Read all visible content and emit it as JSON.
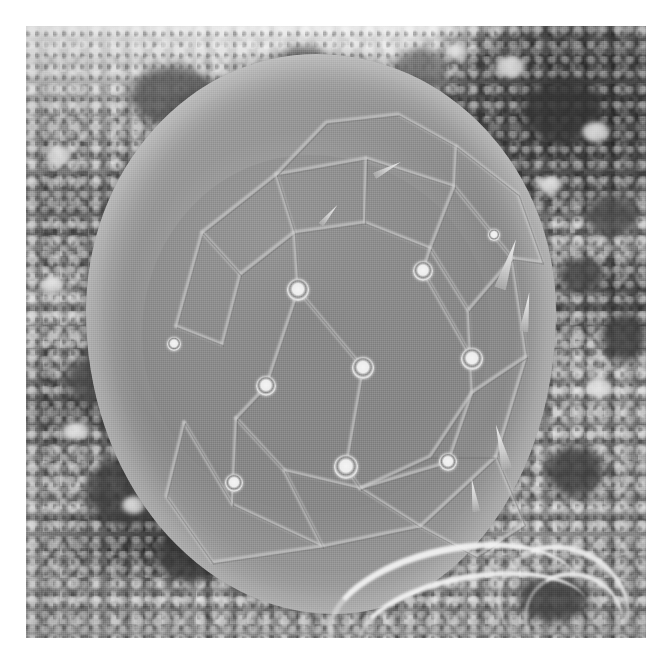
{
  "image": {
    "kind": "sem-micrograph",
    "title": "Scanning electron micrograph of a spherical microfossil / cyst",
    "caption": "",
    "border_color": "#ffffff",
    "plate": {
      "x": 26,
      "y": 26,
      "width": 620,
      "height": 612
    }
  },
  "palette": {
    "paper_white": "#ffffff",
    "highlight": "#f2f2f2",
    "rim_bright": "#d8d8d8",
    "plate_mid_gray": "#8f8f8f",
    "seam_light": "#cfcfcf",
    "substrate_gray": "#8a8a8a",
    "void_dark": "#3a3a3a",
    "deep_shadow": "#2e2e2e"
  },
  "specimen": {
    "name": "central-sphere",
    "description": "Large sub-spherical body covered by interlocking polygonal plates with raised seams and circular pores",
    "bounds": {
      "x": 60,
      "y": 28,
      "width": 470,
      "height": 560
    },
    "fill": "#8f8f8f",
    "rim_highlight": "#d8d8d8"
  },
  "pores": [
    {
      "id": "pore-1",
      "cx": 272,
      "cy": 264,
      "r": 11
    },
    {
      "id": "pore-2",
      "cx": 337,
      "cy": 342,
      "r": 11
    },
    {
      "id": "pore-3",
      "cx": 240,
      "cy": 360,
      "r": 10
    },
    {
      "id": "pore-4",
      "cx": 446,
      "cy": 333,
      "r": 11
    },
    {
      "id": "pore-5",
      "cx": 320,
      "cy": 441,
      "r": 12
    },
    {
      "id": "pore-6",
      "cx": 422,
      "cy": 436,
      "r": 9
    },
    {
      "id": "pore-7",
      "cx": 397,
      "cy": 245,
      "r": 10
    },
    {
      "id": "pore-8",
      "cx": 208,
      "cy": 457,
      "r": 9
    },
    {
      "id": "pore-9",
      "cx": 148,
      "cy": 318,
      "r": 7
    },
    {
      "id": "pore-10",
      "cx": 468,
      "cy": 209,
      "r": 6
    }
  ],
  "plate_seams": [
    {
      "id": "seam-outer-ring",
      "points": "150,300 176,206 250,148 340,132 428,160 486,232 500,330 470,430 394,500 296,520 206,478 158,396"
    },
    {
      "id": "seam-inner-ring",
      "points": "196,318 214,248 268,206 338,196 404,222 442,284 446,366 404,430 334,462 258,444 210,392"
    },
    {
      "id": "seam-r1",
      "points": "250,148 268,206"
    },
    {
      "id": "seam-r2",
      "points": "340,132 338,196"
    },
    {
      "id": "seam-r3",
      "points": "428,160 404,222"
    },
    {
      "id": "seam-r4",
      "points": "486,232 442,284"
    },
    {
      "id": "seam-r5",
      "points": "500,330 446,366"
    },
    {
      "id": "seam-r6",
      "points": "470,430 404,430"
    },
    {
      "id": "seam-r7",
      "points": "394,500 334,462"
    },
    {
      "id": "seam-r8",
      "points": "296,520 258,444"
    },
    {
      "id": "seam-r9",
      "points": "206,478 210,392"
    },
    {
      "id": "seam-r10",
      "points": "150,300 196,318"
    },
    {
      "id": "seam-r11",
      "points": "176,206 214,248"
    },
    {
      "id": "seam-c1",
      "points": "268,206 272,264 337,342"
    },
    {
      "id": "seam-c2",
      "points": "404,222 397,245 446,333"
    },
    {
      "id": "seam-c3",
      "points": "210,392 240,360 272,264"
    },
    {
      "id": "seam-c4",
      "points": "334,462 320,441 337,342"
    },
    {
      "id": "seam-c5",
      "points": "446,366 422,436 334,462"
    },
    {
      "id": "seam-top-lobe",
      "points": "250,148 300,96 372,88 430,120 428,160"
    },
    {
      "id": "seam-upper-flank",
      "points": "430,120 492,168 516,236 486,232"
    },
    {
      "id": "seam-lower-left",
      "points": "158,396 140,470 186,536 296,520"
    },
    {
      "id": "seam-lower-right",
      "points": "394,500 450,530 498,498 470,430"
    }
  ],
  "background": {
    "name": "granular-substrate",
    "description": "Porous, granular debris matrix surrounding the specimen with dark voids and bright flecks"
  },
  "voids": [
    {
      "id": "void-1",
      "x": 498,
      "y": 52,
      "w": 78,
      "h": 66,
      "color": "#373737"
    },
    {
      "id": "void-2",
      "x": 560,
      "y": 170,
      "w": 52,
      "h": 40,
      "color": "#4a4a4a"
    },
    {
      "id": "void-3",
      "x": 534,
      "y": 232,
      "w": 44,
      "h": 34,
      "color": "#454545"
    },
    {
      "id": "void-4",
      "x": 576,
      "y": 288,
      "w": 44,
      "h": 48,
      "color": "#3f3f3f"
    },
    {
      "id": "void-5",
      "x": 104,
      "y": 40,
      "w": 86,
      "h": 60,
      "color": "#5a5a5a"
    },
    {
      "id": "void-6",
      "x": 40,
      "y": 330,
      "w": 60,
      "h": 48,
      "color": "#4e4e4e"
    },
    {
      "id": "void-7",
      "x": 60,
      "y": 430,
      "w": 80,
      "h": 70,
      "color": "#3d3d3d"
    },
    {
      "id": "void-8",
      "x": 130,
      "y": 500,
      "w": 70,
      "h": 56,
      "color": "#3a3a3a"
    },
    {
      "id": "void-9",
      "x": 520,
      "y": 420,
      "w": 58,
      "h": 50,
      "color": "#3e3e3e"
    },
    {
      "id": "void-10",
      "x": 492,
      "y": 548,
      "w": 70,
      "h": 48,
      "color": "#434343"
    },
    {
      "id": "void-11",
      "x": 246,
      "y": 20,
      "w": 62,
      "h": 56,
      "color": "#6e6e6e"
    },
    {
      "id": "void-12",
      "x": 368,
      "y": 22,
      "w": 52,
      "h": 48,
      "color": "#707070"
    }
  ],
  "flecks": [
    {
      "id": "fleck-1",
      "x": 470,
      "y": 30,
      "w": 30,
      "h": 22
    },
    {
      "id": "fleck-2",
      "x": 556,
      "y": 96,
      "w": 28,
      "h": 20
    },
    {
      "id": "fleck-3",
      "x": 512,
      "y": 150,
      "w": 24,
      "h": 18
    },
    {
      "id": "fleck-4",
      "x": 20,
      "y": 120,
      "w": 26,
      "h": 20
    },
    {
      "id": "fleck-5",
      "x": 14,
      "y": 250,
      "w": 24,
      "h": 18
    },
    {
      "id": "fleck-6",
      "x": 36,
      "y": 396,
      "w": 28,
      "h": 18
    },
    {
      "id": "fleck-7",
      "x": 96,
      "y": 470,
      "w": 24,
      "h": 18
    },
    {
      "id": "fleck-8",
      "x": 560,
      "y": 352,
      "w": 26,
      "h": 20
    },
    {
      "id": "fleck-9",
      "x": 420,
      "y": 18,
      "w": 22,
      "h": 16
    }
  ],
  "shards": [
    {
      "id": "shard-1",
      "x": 476,
      "y": 212,
      "w": 12,
      "h": 52,
      "rot": 18
    },
    {
      "id": "shard-2",
      "x": 496,
      "y": 266,
      "w": 9,
      "h": 40,
      "rot": 8
    },
    {
      "id": "shard-3",
      "x": 470,
      "y": 398,
      "w": 11,
      "h": 46,
      "rot": -14
    },
    {
      "id": "shard-4",
      "x": 444,
      "y": 452,
      "w": 8,
      "h": 34,
      "rot": -8
    },
    {
      "id": "shard-5",
      "x": 358,
      "y": 128,
      "w": 7,
      "h": 30,
      "rot": 62
    },
    {
      "id": "shard-6",
      "x": 300,
      "y": 176,
      "w": 6,
      "h": 26,
      "rot": 40
    }
  ],
  "filaments": [
    {
      "id": "filament-1",
      "x": 300,
      "y": 520,
      "w": 250,
      "h": 120,
      "rot": -12,
      "thickness": 7
    },
    {
      "id": "filament-2",
      "x": 330,
      "y": 548,
      "w": 230,
      "h": 96,
      "rot": -10,
      "thickness": 6
    },
    {
      "id": "filament-3",
      "x": 470,
      "y": 520,
      "w": 130,
      "h": 110,
      "rot": 24,
      "thickness": 6
    },
    {
      "id": "filament-4",
      "x": 498,
      "y": 546,
      "w": 96,
      "h": 88,
      "rot": 18,
      "thickness": 5
    }
  ]
}
